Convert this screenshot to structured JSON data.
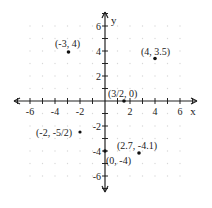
{
  "chart_data": {
    "type": "scatter",
    "title": "",
    "xlabel": "x",
    "ylabel": "y",
    "xlim": [
      -7,
      7
    ],
    "ylim": [
      -7,
      7
    ],
    "grid": "dotted",
    "x_tick_labels": [
      "-6",
      "-4",
      "-2",
      "2",
      "4",
      "6"
    ],
    "y_tick_labels": [
      "6",
      "4",
      "2",
      "-2",
      "-4",
      "-6"
    ],
    "points": [
      {
        "label": "(-3, 4)",
        "x": -3,
        "y": 4
      },
      {
        "label": "(4, 3.5)",
        "x": 4,
        "y": 3.5
      },
      {
        "label": "(3/2, 0)",
        "x": 1.5,
        "y": 0
      },
      {
        "label": "(-2, -5/2)",
        "x": -2,
        "y": -2.5
      },
      {
        "label": "(2.7, -4.1)",
        "x": 2.7,
        "y": -4.1
      },
      {
        "label": "(0, -4)",
        "x": 0,
        "y": -4
      }
    ]
  },
  "axes": {
    "x_name": "x",
    "y_name": "y"
  },
  "colors": {
    "axis": "#222222",
    "point": "#111111",
    "grid": "#d8d8d8"
  }
}
